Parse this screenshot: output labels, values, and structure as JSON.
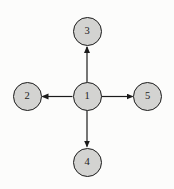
{
  "diagram": {
    "type": "hub-and-spoke-graph",
    "nodes": [
      {
        "id": "1",
        "label": "1",
        "role": "hub",
        "position": "center"
      },
      {
        "id": "2",
        "label": "2",
        "role": "spoke",
        "position": "left"
      },
      {
        "id": "3",
        "label": "3",
        "role": "spoke",
        "position": "top"
      },
      {
        "id": "4",
        "label": "4",
        "role": "spoke",
        "position": "bottom"
      },
      {
        "id": "5",
        "label": "5",
        "role": "spoke",
        "position": "right"
      }
    ],
    "edges": [
      {
        "from": "1",
        "to": "3",
        "direction": "up"
      },
      {
        "from": "1",
        "to": "2",
        "direction": "left"
      },
      {
        "from": "1",
        "to": "5",
        "direction": "right"
      },
      {
        "from": "1",
        "to": "4",
        "direction": "down"
      }
    ],
    "colors": {
      "node_fill": "#d3d3d1",
      "node_border": "#1b1b1b",
      "arrow": "#1b1b1b",
      "label_text": "#222222",
      "background": "#fcfcfb"
    }
  }
}
